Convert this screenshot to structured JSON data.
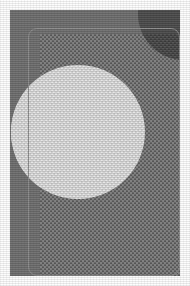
{
  "image": {
    "title": "Dithered Grayscale Geometric Composition",
    "width": 190,
    "height": 286,
    "style": "ordered-dither halftone, low bit-depth grayscale scan",
    "caption": ""
  },
  "palette": {
    "paper_white": "#fdfdfd",
    "background_gray": "#6e6e6e",
    "dither_panel_gray": "#7a7a7a",
    "dark_circle_gray": "#4b4b4b",
    "light_circle_gray": "#dcdcdc",
    "outline_gray": "#8a8a8a"
  },
  "shapes": [
    {
      "name": "background-panel",
      "kind": "rectangle",
      "fill": "#6e6e6e",
      "x": 10,
      "y": 10,
      "width": 170,
      "height": 266
    },
    {
      "name": "rounded-outline",
      "kind": "rounded-rectangle-outline",
      "stroke": "#8a8a8a",
      "x": 28,
      "y": 28,
      "width": 152,
      "height": 248,
      "radius": 9
    },
    {
      "name": "dither-panel",
      "kind": "rectangle",
      "fill": "#7a7a7a",
      "pattern": "checker-dither",
      "x": 40,
      "y": 34,
      "width": 140,
      "height": 242
    },
    {
      "name": "dark-corner-circle",
      "kind": "circle",
      "fill": "#4b4b4b",
      "cx": 184,
      "cy": 14,
      "radius": 46
    },
    {
      "name": "light-circle",
      "kind": "circle",
      "fill": "#dcdcdc",
      "pattern": "checker-dither",
      "cx": 78,
      "cy": 132,
      "radius": 67
    }
  ],
  "layers": {
    "grain_label": "film-grain-noise",
    "band_label": "vertical-scan-banding"
  }
}
